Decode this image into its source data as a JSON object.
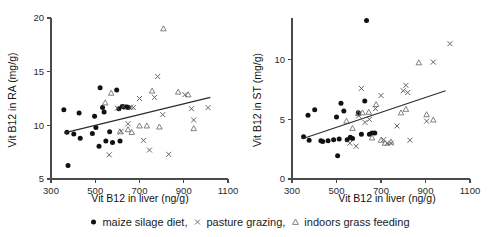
{
  "chart_data": [
    {
      "type": "scatter",
      "panel": "left",
      "title": "",
      "xlabel": "Vit B12 in liver (ng/g)",
      "ylabel": "Vit B12 in RA (mg/g)",
      "xlim": [
        300,
        1100
      ],
      "ylim": [
        5,
        20
      ],
      "xticks": [
        300,
        500,
        700,
        900,
        1100
      ],
      "yticks": [
        5,
        10,
        15,
        20
      ],
      "grid": false,
      "legend_position": "below-figure",
      "series": [
        {
          "name": "maize silage diet",
          "marker": "filled-circle",
          "color": "#111111",
          "points": [
            [
              358,
              11.45
            ],
            [
              372,
              9.35
            ],
            [
              377,
              6.25
            ],
            [
              403,
              9.2
            ],
            [
              427,
              11.15
            ],
            [
              432,
              8.8
            ],
            [
              487,
              9.25
            ],
            [
              497,
              10.85
            ],
            [
              503,
              9.8
            ],
            [
              517,
              8.05
            ],
            [
              522,
              13.5
            ],
            [
              533,
              11.65
            ],
            [
              540,
              11.25
            ],
            [
              548,
              8.55
            ],
            [
              565,
              9.4
            ],
            [
              578,
              8.4
            ],
            [
              597,
              13.3
            ],
            [
              607,
              11.55
            ],
            [
              612,
              8.55
            ],
            [
              622,
              11.75
            ],
            [
              630,
              11.7
            ],
            [
              643,
              11.7
            ],
            [
              650,
              11.65
            ]
          ]
        },
        {
          "name": "pasture grazing",
          "marker": "cross",
          "color": "#5d5d5d",
          "points": [
            [
              563,
              7.25
            ],
            [
              600,
              11.6
            ],
            [
              617,
              9.45
            ],
            [
              627,
              11.75
            ],
            [
              648,
              10.15
            ],
            [
              660,
              11.7
            ],
            [
              672,
              11.65
            ],
            [
              700,
              12.5
            ],
            [
              718,
              8.6
            ],
            [
              745,
              7.7
            ],
            [
              768,
              12.6
            ],
            [
              782,
              14.55
            ],
            [
              805,
              11.0
            ],
            [
              832,
              7.3
            ],
            [
              905,
              12.85
            ],
            [
              935,
              11.55
            ],
            [
              945,
              10.5
            ],
            [
              1010,
              11.65
            ]
          ]
        },
        {
          "name": "indoors grass feeding",
          "marker": "triangle",
          "color": "#6b6b6b",
          "points": [
            [
              545,
              12.1
            ],
            [
              572,
              13.0
            ],
            [
              612,
              9.4
            ],
            [
              648,
              9.6
            ],
            [
              665,
              9.35
            ],
            [
              700,
              9.95
            ],
            [
              733,
              9.95
            ],
            [
              757,
              13.2
            ],
            [
              790,
              9.85
            ],
            [
              808,
              19.0
            ],
            [
              875,
              13.1
            ],
            [
              920,
              12.85
            ],
            [
              945,
              9.7
            ]
          ]
        }
      ],
      "trend_line": {
        "x": [
          360,
          1020
        ],
        "y": [
          9.3,
          12.6
        ]
      }
    },
    {
      "type": "scatter",
      "panel": "right",
      "title": "",
      "xlabel": "Vit B12 in liver (ng/g)",
      "ylabel": "Vit B12 in ST (mg/g)",
      "xlim": [
        300,
        1100
      ],
      "ylim": [
        0,
        13.5
      ],
      "xticks": [
        300,
        500,
        700,
        900,
        1100
      ],
      "yticks": [
        0,
        5,
        10
      ],
      "grid": false,
      "legend_position": "below-figure",
      "series": [
        {
          "name": "maize silage diet",
          "marker": "filled-circle",
          "color": "#111111",
          "points": [
            [
              352,
              3.55
            ],
            [
              372,
              5.35
            ],
            [
              377,
              3.25
            ],
            [
              402,
              5.8
            ],
            [
              430,
              3.2
            ],
            [
              438,
              3.15
            ],
            [
              462,
              3.2
            ],
            [
              487,
              3.3
            ],
            [
              500,
              5.2
            ],
            [
              505,
              1.95
            ],
            [
              512,
              3.35
            ],
            [
              520,
              6.35
            ],
            [
              533,
              5.7
            ],
            [
              548,
              3.3
            ],
            [
              562,
              3.5
            ],
            [
              572,
              3.4
            ],
            [
              598,
              5.55
            ],
            [
              612,
              3.75
            ],
            [
              627,
              6.55
            ],
            [
              635,
              13.3
            ],
            [
              648,
              3.75
            ],
            [
              660,
              3.85
            ],
            [
              672,
              3.85
            ]
          ]
        },
        {
          "name": "pasture grazing",
          "marker": "cross",
          "color": "#5d5d5d",
          "points": [
            [
              560,
              3.0
            ],
            [
              588,
              2.75
            ],
            [
              600,
              5.3
            ],
            [
              612,
              7.6
            ],
            [
              628,
              4.75
            ],
            [
              648,
              5.0
            ],
            [
              675,
              5.9
            ],
            [
              700,
              7.0
            ],
            [
              712,
              3.3
            ],
            [
              728,
              3.0
            ],
            [
              745,
              3.0
            ],
            [
              772,
              4.45
            ],
            [
              800,
              7.4
            ],
            [
              812,
              7.85
            ],
            [
              820,
              7.25
            ],
            [
              830,
              3.25
            ],
            [
              905,
              4.85
            ],
            [
              935,
              9.8
            ],
            [
              1010,
              11.35
            ]
          ]
        },
        {
          "name": "indoors grass feeding",
          "marker": "triangle",
          "color": "#6b6b6b",
          "points": [
            [
              545,
              4.85
            ],
            [
              572,
              4.25
            ],
            [
              598,
              5.5
            ],
            [
              617,
              5.55
            ],
            [
              645,
              5.6
            ],
            [
              660,
              3.45
            ],
            [
              678,
              6.25
            ],
            [
              700,
              3.25
            ],
            [
              718,
              3.0
            ],
            [
              745,
              3.1
            ],
            [
              790,
              5.55
            ],
            [
              812,
              5.85
            ],
            [
              870,
              9.75
            ],
            [
              905,
              5.4
            ],
            [
              935,
              4.95
            ]
          ]
        }
      ],
      "trend_line": {
        "x": [
          350,
          990
        ],
        "y": [
          3.4,
          7.4
        ]
      }
    }
  ],
  "legend": {
    "entries": [
      {
        "symbol": "filled-circle",
        "label": "maize silage diet",
        "separator": ","
      },
      {
        "symbol": "cross",
        "label": "pasture grazing",
        "separator": ","
      },
      {
        "symbol": "triangle",
        "label": "indoors grass feeding",
        "separator": ""
      }
    ]
  }
}
